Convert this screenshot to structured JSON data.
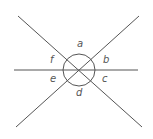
{
  "diagram": {
    "colors": {
      "line": "#555555",
      "label": "#555555",
      "background": "#ffffff"
    },
    "center": {
      "x": 79,
      "y": 70
    },
    "circle_radius": 16,
    "lines": [
      {
        "name": "horizontal",
        "x1": 14,
        "y1": 70,
        "x2": 138,
        "y2": 70
      },
      {
        "name": "diagonal-down",
        "x1": 18,
        "y1": 16,
        "x2": 142,
        "y2": 127
      },
      {
        "name": "diagonal-up",
        "x1": 16,
        "y1": 127,
        "x2": 139,
        "y2": 16
      }
    ],
    "labels": [
      {
        "text": "a",
        "x": 77,
        "y": 47
      },
      {
        "text": "b",
        "x": 103,
        "y": 63
      },
      {
        "text": "c",
        "x": 102,
        "y": 82
      },
      {
        "text": "d",
        "x": 76,
        "y": 96
      },
      {
        "text": "e",
        "x": 50,
        "y": 82
      },
      {
        "text": "f",
        "x": 50,
        "y": 63
      }
    ]
  }
}
